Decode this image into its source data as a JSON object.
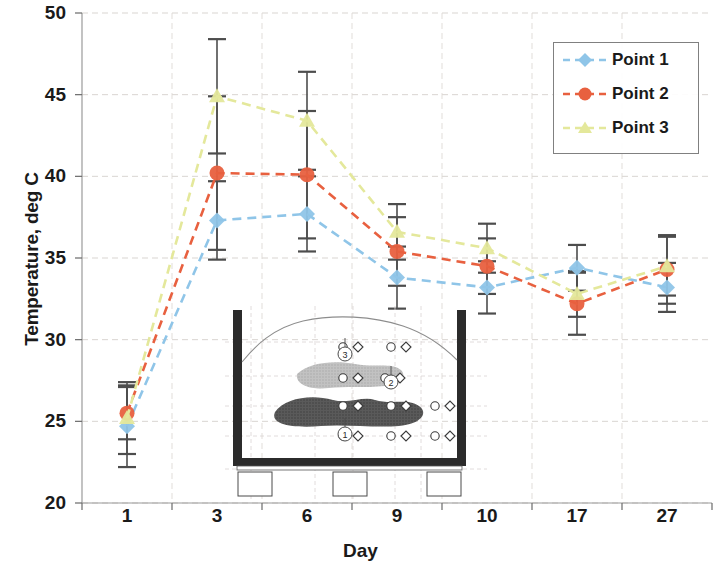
{
  "chart_data": {
    "type": "line",
    "title": "",
    "xlabel": "Day",
    "ylabel": "Temperature, deg C",
    "categories": [
      "1",
      "3",
      "6",
      "9",
      "10",
      "17",
      "27"
    ],
    "ylim": [
      20,
      50
    ],
    "yticks": [
      20,
      25,
      30,
      35,
      40,
      45,
      50
    ],
    "grid": true,
    "legend_position": "top-right",
    "series": [
      {
        "name": "Point 1",
        "color": "#8FC5E8",
        "marker": "diamond",
        "linestyle": "dashed",
        "values": [
          24.7,
          37.3,
          37.7,
          33.8,
          33.2,
          34.4,
          33.2
        ],
        "errors": [
          2.5,
          2.4,
          2.3,
          1.9,
          1.6,
          1.4,
          1.5
        ]
      },
      {
        "name": "Point 2",
        "color": "#E8603F",
        "marker": "circle",
        "linestyle": "dashed",
        "values": [
          25.5,
          40.2,
          40.1,
          35.4,
          34.5,
          32.2,
          34.3
        ],
        "errors": [
          1.6,
          4.7,
          3.9,
          2.1,
          1.7,
          1.9,
          2.1
        ]
      },
      {
        "name": "Point 3",
        "color": "#E4E89B",
        "marker": "triangle",
        "linestyle": "dashed",
        "values": [
          25.2,
          44.9,
          43.4,
          36.6,
          35.6,
          32.8,
          34.5
        ],
        "errors": [
          2.2,
          3.5,
          3.0,
          1.7,
          1.5,
          1.4,
          1.8
        ]
      }
    ]
  },
  "legend": {
    "items": [
      {
        "label": "Point 1"
      },
      {
        "label": "Point 2"
      },
      {
        "label": "Point 3"
      }
    ]
  },
  "inset": {
    "caption": "",
    "sensor_labels": [
      "1",
      "2",
      "3"
    ]
  }
}
